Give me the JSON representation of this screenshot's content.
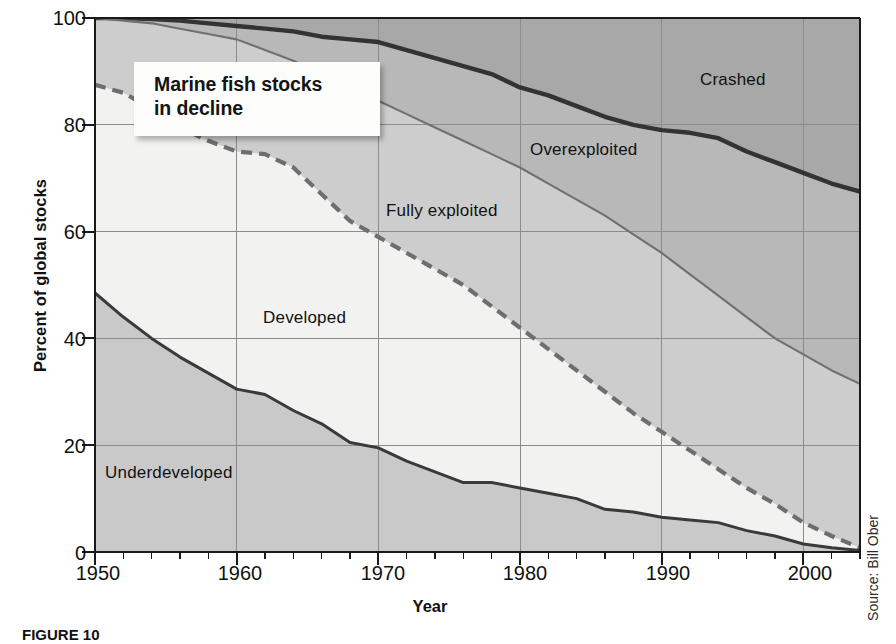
{
  "figure": {
    "caption": "FIGURE 10",
    "source_note": "Source: Bill Ober",
    "callout_line1": "Marine fish stocks",
    "callout_line2": "in decline"
  },
  "chart_data": {
    "type": "area",
    "title": "Marine fish stocks in decline",
    "xlabel": "Year",
    "ylabel": "Percent of global stocks",
    "xlim": [
      1950,
      2004
    ],
    "ylim": [
      0,
      100
    ],
    "grid": true,
    "legend_position": "in-plot-labels",
    "ytick_labels": [
      "0",
      "20",
      "40",
      "60",
      "80",
      "100"
    ],
    "ytick_values": [
      0,
      20,
      40,
      60,
      80,
      100
    ],
    "xtick_labels": [
      "1950",
      "1960",
      "1970",
      "1980",
      "1990",
      "2000"
    ],
    "xtick_values": [
      1950,
      1960,
      1970,
      1980,
      1990,
      2000
    ],
    "minor_tick_interval_years": 2,
    "stacking": "cumulative-percent-bottom-to-top",
    "band_order": [
      "Underdeveloped",
      "Developed",
      "Fully exploited",
      "Overexploited",
      "Crashed"
    ],
    "colors": {
      "underdeveloped": "#c9c9c9",
      "developed": "#f2f2f0",
      "fully_exploited": "#cdcdcd",
      "overexploited": "#b8b8b8",
      "crashed": "#a8a8a8",
      "solid_line": "#3a3a3a",
      "dashed_line": "#6e6e6e",
      "thin_line": "#707070",
      "thick_line": "#333333",
      "grid": "#8c8c8c",
      "axis": "#1a1a1a"
    },
    "x": [
      1950,
      1952,
      1954,
      1956,
      1958,
      1960,
      1962,
      1964,
      1966,
      1968,
      1970,
      1972,
      1974,
      1976,
      1978,
      1980,
      1982,
      1984,
      1986,
      1988,
      1990,
      1992,
      1994,
      1996,
      1998,
      2000,
      2002,
      2004
    ],
    "series": [
      {
        "name": "Underdeveloped",
        "label": "Underdeveloped",
        "cumulative_top": [
          48.5,
          44.0,
          40.0,
          36.5,
          33.5,
          30.5,
          29.5,
          26.5,
          24.0,
          20.5,
          19.5,
          17.0,
          15.0,
          13.0,
          13.0,
          12.0,
          11.0,
          10.0,
          8.0,
          7.5,
          6.5,
          6.0,
          5.5,
          4.0,
          3.0,
          1.5,
          0.8,
          0.3
        ]
      },
      {
        "name": "Developed",
        "label": "Developed",
        "cumulative_top": [
          87.5,
          86.0,
          83.0,
          79.5,
          77.0,
          75.0,
          74.5,
          72.0,
          67.0,
          62.0,
          59.0,
          56.0,
          53.0,
          50.0,
          46.0,
          42.0,
          38.0,
          34.0,
          30.0,
          26.0,
          22.5,
          19.0,
          15.5,
          12.0,
          9.0,
          5.5,
          3.0,
          0.8
        ]
      },
      {
        "name": "Fully exploited",
        "label": "Fully exploited",
        "cumulative_top": [
          100,
          99.5,
          99.0,
          98.0,
          97.0,
          96.0,
          94.0,
          92.0,
          89.5,
          87.0,
          84.5,
          82.0,
          79.5,
          77.0,
          74.5,
          72.0,
          69.0,
          66.0,
          63.0,
          59.5,
          56.0,
          52.0,
          48.0,
          44.0,
          40.0,
          37.0,
          34.0,
          31.5
        ]
      },
      {
        "name": "Overexploited",
        "label": "Overexploited",
        "cumulative_top": [
          100,
          100,
          99.8,
          99.5,
          99.0,
          98.5,
          98.0,
          97.5,
          96.5,
          96.0,
          95.5,
          94.0,
          92.5,
          91.0,
          89.5,
          87.0,
          85.5,
          83.5,
          81.5,
          80.0,
          79.0,
          78.5,
          77.5,
          75.0,
          73.0,
          71.0,
          69.0,
          67.5
        ]
      },
      {
        "name": "Crashed",
        "label": "Crashed",
        "cumulative_top": [
          100,
          100,
          100,
          100,
          100,
          100,
          100,
          100,
          100,
          100,
          100,
          100,
          100,
          100,
          100,
          100,
          100,
          100,
          100,
          100,
          100,
          100,
          100,
          100,
          100,
          100,
          100,
          100
        ]
      }
    ],
    "band_label_positions": [
      {
        "name": "Crashed",
        "x_px": 700,
        "y_px": 72
      },
      {
        "name": "Overexploited",
        "x_px": 530,
        "y_px": 142
      },
      {
        "name": "Fully exploited",
        "x_px": 386,
        "y_px": 203
      },
      {
        "name": "Developed",
        "x_px": 263,
        "y_px": 310
      },
      {
        "name": "Underdeveloped",
        "x_px": 105,
        "y_px": 465
      }
    ]
  }
}
